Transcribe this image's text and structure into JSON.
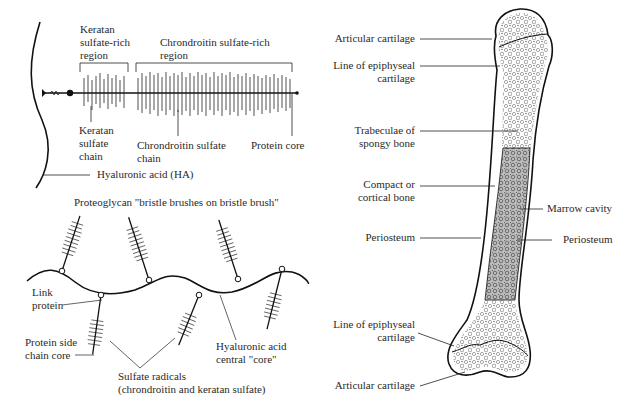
{
  "proteoglycan_detail": {
    "keratan_region": [
      "Keratan",
      "sulfate-rich",
      "region"
    ],
    "chondroitin_region": [
      "Chrondroitin sulfate-rich",
      "region"
    ],
    "keratan_chain": [
      "Keratan",
      "sulfate",
      "chain"
    ],
    "chondroitin_chain": [
      "Chrondroitin sulfate",
      "chain"
    ],
    "protein_core": "Protein core",
    "hyaluronic_acid": "Hyaluronic acid (HA)"
  },
  "bristle_brush": {
    "title": "Proteoglycan \"bristle brushes on bristle brush\"",
    "link_protein": [
      "Link",
      "protein"
    ],
    "protein_side_chain": [
      "Protein side",
      "chain core"
    ],
    "hyaluronic_core": [
      "Hyaluronic acid",
      "central \"core\""
    ],
    "sulfate_radicals": [
      "Sulfate radicals",
      "(chrondroitin and keratan sulfate)"
    ]
  },
  "bone": {
    "left_labels": {
      "articular_top": "Articular cartilage",
      "epiphyseal_top": [
        "Line of epiphyseal",
        "cartilage"
      ],
      "trabeculae": [
        "Trabeculae of",
        "spongy bone"
      ],
      "compact": [
        "Compact or",
        "cortical bone"
      ],
      "periosteum_left": "Periosteum",
      "epiphyseal_bottom": [
        "Line of epiphyseal",
        "cartilage"
      ],
      "articular_bottom": "Articular cartilage"
    },
    "right_labels": {
      "marrow": "Marrow cavity",
      "periosteum_right": "Periosteum"
    }
  },
  "colors": {
    "ink": "#1a1a1a",
    "label": "#2a2a2a",
    "background": "#ffffff"
  }
}
